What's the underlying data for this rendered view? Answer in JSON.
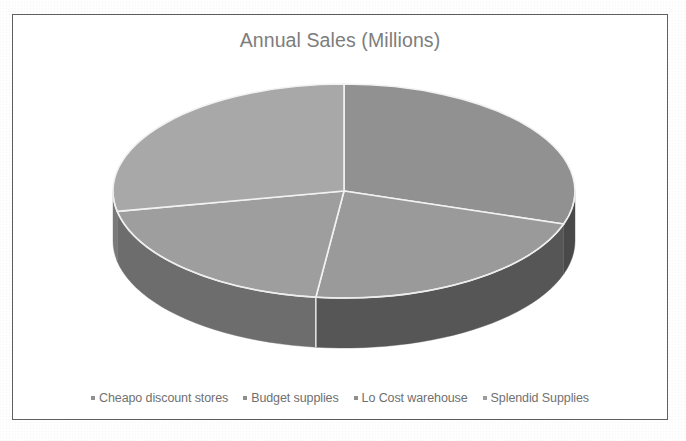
{
  "chart_data": {
    "type": "pie",
    "title": "Annual Sales (Millions)",
    "three_d": true,
    "legend_position": "bottom",
    "grid": false,
    "categories": [
      "Cheapo discount stores",
      "Budget supplies",
      "Lo Cost warehouse",
      "Splendid Supplies"
    ],
    "values": [
      30,
      22,
      20,
      28
    ],
    "labels_shown": false,
    "slices": [
      {
        "name": "Cheapo discount stores",
        "value": 30,
        "percent": 30,
        "color": "#919191",
        "side_color": "#4a4a4a",
        "start_angle_deg": 0,
        "end_angle_deg": 108
      },
      {
        "name": "Budget supplies",
        "value": 22,
        "percent": 22,
        "color": "#9a9a9a",
        "side_color": "#575757",
        "start_angle_deg": 108,
        "end_angle_deg": 187
      },
      {
        "name": "Lo Cost warehouse",
        "value": 20,
        "percent": 20,
        "color": "#9e9e9e",
        "side_color": "#6d6d6d",
        "start_angle_deg": 187,
        "end_angle_deg": 259
      },
      {
        "name": "Splendid Supplies",
        "value": 28,
        "percent": 28,
        "color": "#a8a8a8",
        "side_color": "#7a7a7a",
        "start_angle_deg": 259,
        "end_angle_deg": 360
      }
    ]
  },
  "chart": {
    "title": "Annual Sales (Millions)",
    "title_color": "#7d7d7d",
    "frame_color": "#5a5a5a",
    "background": "#ffffff",
    "separator_color": "#f2f2f2"
  },
  "legend": {
    "items": [
      {
        "label": "Cheapo discount stores",
        "swatch_color": "#8f8f8f"
      },
      {
        "label": "Budget supplies",
        "swatch_color": "#8f8f8f"
      },
      {
        "label": "Lo Cost warehouse",
        "swatch_color": "#8f8f8f"
      },
      {
        "label": "Splendid Supplies",
        "swatch_color": "#9c9c9c"
      }
    ],
    "text_color": "#6f6f6f"
  }
}
